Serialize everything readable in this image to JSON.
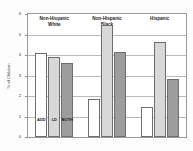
{
  "chart_data": {
    "type": "bar",
    "title": "",
    "xlabel": "",
    "ylabel": "% of Children",
    "ylim": [
      0,
      6
    ],
    "yticks": [
      0,
      1,
      2,
      3,
      4,
      5,
      6
    ],
    "grid": true,
    "legend_position": "in-plot-bar-labels",
    "categories": [
      "Non-Hispanic White",
      "Non-Hispanic Black",
      "Hispanic"
    ],
    "category_lines": [
      [
        "Non-Hispanic",
        "White"
      ],
      [
        "Non-Hispanic",
        "Black"
      ],
      [
        "Hispanic"
      ]
    ],
    "series": [
      {
        "name": "ADD",
        "color": "#ffffff",
        "values": [
          4.1,
          1.85,
          1.45
        ]
      },
      {
        "name": "LD",
        "color": "#d8d8d8",
        "values": [
          3.9,
          5.45,
          4.65
        ]
      },
      {
        "name": "BOTH",
        "color": "#9d9d9d",
        "values": [
          3.6,
          4.15,
          2.85
        ]
      }
    ],
    "bar_labels_shown_in_group": 0
  },
  "axis": {
    "tick_labels": [
      "0",
      "1",
      "2",
      "3",
      "4",
      "5",
      "6"
    ]
  }
}
